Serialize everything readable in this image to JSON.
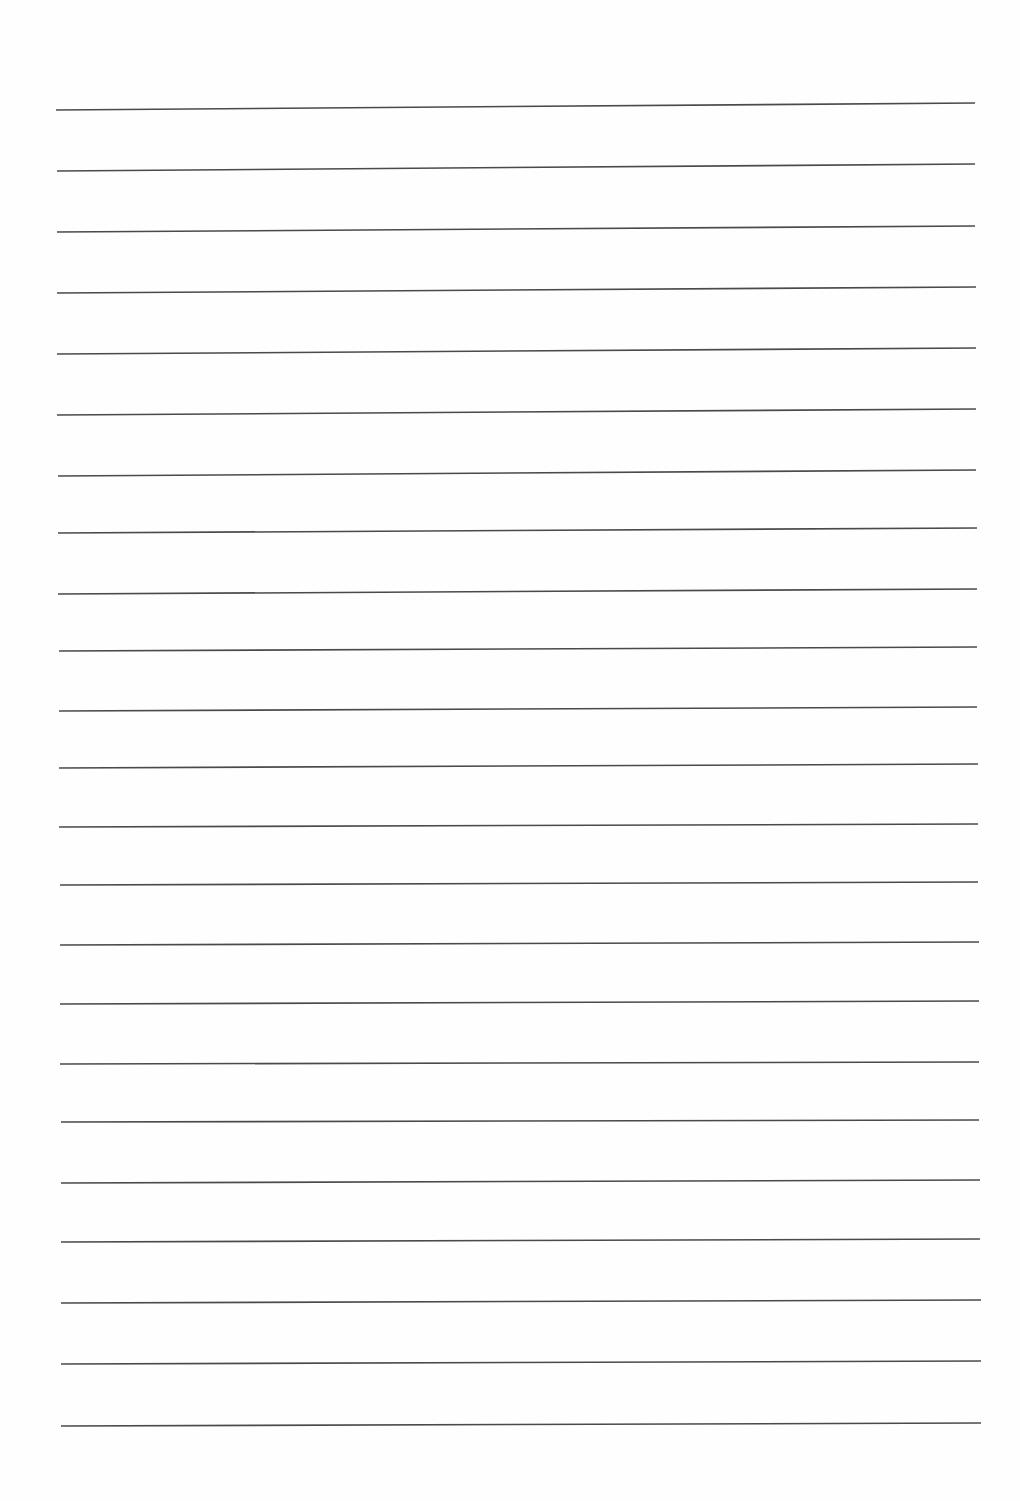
{
  "page": {
    "type": "ruled-paper",
    "background_color": "#fefefe",
    "line_color": "#4a4a4a",
    "line_width": 1.6,
    "line_count": 23,
    "lines": [
      {
        "x1": 56,
        "y1": 110,
        "x2": 975,
        "y2": 103
      },
      {
        "x1": 57,
        "y1": 171,
        "x2": 975,
        "y2": 164
      },
      {
        "x1": 57,
        "y1": 232,
        "x2": 975,
        "y2": 226
      },
      {
        "x1": 57,
        "y1": 293,
        "x2": 976,
        "y2": 287
      },
      {
        "x1": 57,
        "y1": 354,
        "x2": 976,
        "y2": 348
      },
      {
        "x1": 57,
        "y1": 415,
        "x2": 976,
        "y2": 409
      },
      {
        "x1": 58,
        "y1": 476,
        "x2": 976,
        "y2": 470
      },
      {
        "x1": 58,
        "y1": 533,
        "x2": 977,
        "y2": 528
      },
      {
        "x1": 58,
        "y1": 594,
        "x2": 977,
        "y2": 589
      },
      {
        "x1": 59,
        "y1": 651,
        "x2": 977,
        "y2": 647
      },
      {
        "x1": 59,
        "y1": 711,
        "x2": 977,
        "y2": 707
      },
      {
        "x1": 59,
        "y1": 768,
        "x2": 978,
        "y2": 764
      },
      {
        "x1": 59,
        "y1": 827,
        "x2": 978,
        "y2": 824
      },
      {
        "x1": 60,
        "y1": 885,
        "x2": 978,
        "y2": 882
      },
      {
        "x1": 60,
        "y1": 945,
        "x2": 979,
        "y2": 942
      },
      {
        "x1": 60,
        "y1": 1004,
        "x2": 979,
        "y2": 1001
      },
      {
        "x1": 60,
        "y1": 1064,
        "x2": 979,
        "y2": 1062
      },
      {
        "x1": 61,
        "y1": 1122,
        "x2": 979,
        "y2": 1120
      },
      {
        "x1": 61,
        "y1": 1183,
        "x2": 980,
        "y2": 1180
      },
      {
        "x1": 61,
        "y1": 1242,
        "x2": 980,
        "y2": 1239
      },
      {
        "x1": 61,
        "y1": 1303,
        "x2": 981,
        "y2": 1300
      },
      {
        "x1": 61,
        "y1": 1364,
        "x2": 981,
        "y2": 1361
      },
      {
        "x1": 61,
        "y1": 1426,
        "x2": 981,
        "y2": 1423
      }
    ]
  }
}
